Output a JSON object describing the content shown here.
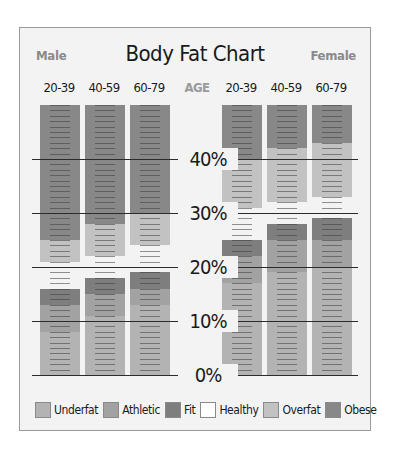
{
  "chart": {
    "title": "Body Fat Chart",
    "male_label": "Male",
    "female_label": "Female",
    "age_label": "AGE",
    "age_groups_male": [
      "20-39",
      "40-59",
      "60-79"
    ],
    "age_groups_female": [
      "20-39",
      "40-59",
      "60-79"
    ],
    "y_ticks": [
      "0%",
      "10%",
      "20%",
      "30%",
      "40%"
    ],
    "legend": [
      "Underfat",
      "Athletic",
      "Fit",
      "Healthy",
      "Overfat",
      "Obese"
    ]
  },
  "colors": {
    "Underfat": "#b3b3b3",
    "Athletic": "#a2a2a2",
    "Fit": "#7e7e7e",
    "Healthy": "#ffffff",
    "Overfat": "#c2c2c2",
    "Obese": "#888888"
  },
  "chart_data": {
    "type": "bar",
    "subtype": "stacked-range",
    "title": "Body Fat Chart",
    "xlabel": "AGE",
    "ylabel": "",
    "ylim": [
      0,
      50
    ],
    "y_ticks": [
      0,
      10,
      20,
      30,
      40
    ],
    "grid": true,
    "legend_position": "bottom",
    "categories": [
      "Male 20-39",
      "Male 40-59",
      "Male 60-79",
      "Female 20-39",
      "Female 40-59",
      "Female 60-79"
    ],
    "series": [
      {
        "name": "Underfat",
        "ranges": [
          [
            0,
            8
          ],
          [
            0,
            11
          ],
          [
            0,
            13
          ],
          [
            0,
            17
          ],
          [
            0,
            19
          ],
          [
            0,
            20
          ]
        ]
      },
      {
        "name": "Athletic",
        "ranges": [
          [
            8,
            13
          ],
          [
            11,
            15
          ],
          [
            13,
            16
          ],
          [
            17,
            22
          ],
          [
            19,
            25
          ],
          [
            20,
            25
          ]
        ]
      },
      {
        "name": "Fit",
        "ranges": [
          [
            13,
            16
          ],
          [
            15,
            18
          ],
          [
            16,
            19
          ],
          [
            22,
            25
          ],
          [
            25,
            28
          ],
          [
            25,
            29
          ]
        ]
      },
      {
        "name": "Healthy",
        "ranges": [
          [
            16,
            21
          ],
          [
            18,
            22
          ],
          [
            19,
            24
          ],
          [
            25,
            31
          ],
          [
            28,
            32
          ],
          [
            29,
            33
          ]
        ]
      },
      {
        "name": "Overfat",
        "ranges": [
          [
            21,
            25
          ],
          [
            22,
            28
          ],
          [
            24,
            30
          ],
          [
            31,
            40
          ],
          [
            32,
            42
          ],
          [
            33,
            43
          ]
        ]
      },
      {
        "name": "Obese",
        "ranges": [
          [
            25,
            50
          ],
          [
            28,
            50
          ],
          [
            30,
            50
          ],
          [
            40,
            50
          ],
          [
            42,
            50
          ],
          [
            43,
            50
          ]
        ]
      }
    ]
  }
}
